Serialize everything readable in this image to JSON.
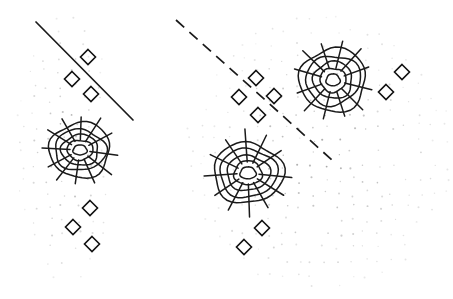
{
  "figure": {
    "title": "",
    "background_color": "#ffffff",
    "width": 453,
    "height": 299,
    "panel_count": 2
  },
  "style": {
    "dot_color": "#8a8a8a",
    "marker_color": "#111111",
    "contour_color": "#1a1a1a",
    "boundary_color": "#1a1a1a"
  },
  "chart_data": {
    "type": "scatter",
    "title": "",
    "subtitle": "",
    "xlabel": "",
    "ylabel": "",
    "grid": false,
    "legend": null,
    "axis_visible": false,
    "tick_labels": [],
    "annotations": [],
    "panels": [
      {
        "name": "left-panel",
        "label": "",
        "boundary": {
          "style": "solid",
          "x1": 36,
          "y1": 22,
          "x2": 133,
          "y2": 120
        },
        "clusters": [
          {
            "name": "left-cluster",
            "cx": 80,
            "cy": 150,
            "rings": [
              {
                "rx": 7,
                "ry": 5
              },
              {
                "rx": 13,
                "ry": 10
              },
              {
                "rx": 19,
                "ry": 15
              },
              {
                "rx": 25,
                "ry": 21
              },
              {
                "rx": 31,
                "ry": 27
              }
            ],
            "spokes": [
              {
                "angle": 8,
                "inner": 10,
                "outer": 38
              },
              {
                "angle": 38,
                "inner": 10,
                "outer": 40
              },
              {
                "angle": 66,
                "inner": 10,
                "outer": 36
              },
              {
                "angle": 98,
                "inner": 10,
                "outer": 34
              },
              {
                "angle": 128,
                "inner": 10,
                "outer": 38
              },
              {
                "angle": 152,
                "inner": 10,
                "outer": 36
              },
              {
                "angle": 183,
                "inner": 10,
                "outer": 38
              },
              {
                "angle": 212,
                "inner": 10,
                "outer": 38
              },
              {
                "angle": 240,
                "inner": 10,
                "outer": 36
              },
              {
                "angle": 272,
                "inner": 10,
                "outer": 33
              },
              {
                "angle": 303,
                "inner": 10,
                "outer": 38
              },
              {
                "angle": 332,
                "inner": 10,
                "outer": 36
              }
            ]
          }
        ],
        "markers": [
          {
            "x": 88,
            "y": 57,
            "size": 7.5
          },
          {
            "x": 72,
            "y": 79,
            "size": 7.5
          },
          {
            "x": 91,
            "y": 94,
            "size": 7.5
          },
          {
            "x": 90,
            "y": 208,
            "size": 7.5
          },
          {
            "x": 73,
            "y": 227,
            "size": 7.5
          },
          {
            "x": 92,
            "y": 244,
            "size": 7.5
          }
        ],
        "points_seed": 11,
        "points_region": {
          "x0": 18,
          "y0": 18,
          "x1": 115,
          "y1": 278,
          "skew": 0.22,
          "count": 210
        }
      },
      {
        "name": "right-panel",
        "label": "",
        "boundary": {
          "style": "dashed",
          "x1": 176,
          "y1": 20,
          "x2": 332,
          "y2": 160
        },
        "clusters": [
          {
            "name": "right-upper-cluster",
            "cx": 333,
            "cy": 80,
            "rings": [
              {
                "rx": 7,
                "ry": 6
              },
              {
                "rx": 13,
                "ry": 12
              },
              {
                "rx": 20,
                "ry": 18
              },
              {
                "rx": 27,
                "ry": 25
              },
              {
                "rx": 34,
                "ry": 31
              }
            ],
            "spokes": [
              {
                "angle": 14,
                "inner": 12,
                "outer": 40
              },
              {
                "angle": 45,
                "inner": 12,
                "outer": 42
              },
              {
                "angle": 72,
                "inner": 12,
                "outer": 38
              },
              {
                "angle": 104,
                "inner": 12,
                "outer": 40
              },
              {
                "angle": 133,
                "inner": 12,
                "outer": 42
              },
              {
                "angle": 160,
                "inner": 12,
                "outer": 38
              },
              {
                "angle": 196,
                "inner": 12,
                "outer": 40
              },
              {
                "angle": 224,
                "inner": 12,
                "outer": 42
              },
              {
                "angle": 252,
                "inner": 12,
                "outer": 38
              },
              {
                "angle": 284,
                "inner": 12,
                "outer": 40
              },
              {
                "angle": 312,
                "inner": 12,
                "outer": 42
              },
              {
                "angle": 340,
                "inner": 12,
                "outer": 38
              }
            ]
          },
          {
            "name": "right-lower-cluster",
            "cx": 248,
            "cy": 173,
            "rings": [
              {
                "rx": 8,
                "ry": 6
              },
              {
                "rx": 14,
                "ry": 12
              },
              {
                "rx": 21,
                "ry": 18
              },
              {
                "rx": 28,
                "ry": 25
              },
              {
                "rx": 34,
                "ry": 31
              }
            ],
            "spokes": [
              {
                "angle": 6,
                "inner": 11,
                "outer": 44
              },
              {
                "angle": 32,
                "inner": 11,
                "outer": 42
              },
              {
                "angle": 60,
                "inner": 11,
                "outer": 40
              },
              {
                "angle": 88,
                "inner": 11,
                "outer": 44
              },
              {
                "angle": 118,
                "inner": 11,
                "outer": 42
              },
              {
                "angle": 146,
                "inner": 11,
                "outer": 40
              },
              {
                "angle": 176,
                "inner": 11,
                "outer": 44
              },
              {
                "angle": 206,
                "inner": 11,
                "outer": 42
              },
              {
                "angle": 236,
                "inner": 11,
                "outer": 40
              },
              {
                "angle": 266,
                "inner": 11,
                "outer": 44
              },
              {
                "angle": 296,
                "inner": 11,
                "outer": 42
              },
              {
                "angle": 326,
                "inner": 11,
                "outer": 40
              }
            ]
          }
        ],
        "markers": [
          {
            "x": 256,
            "y": 78,
            "size": 7.5
          },
          {
            "x": 239,
            "y": 97,
            "size": 7.5
          },
          {
            "x": 274,
            "y": 96,
            "size": 7.5
          },
          {
            "x": 258,
            "y": 115,
            "size": 7.5
          },
          {
            "x": 402,
            "y": 72,
            "size": 7.5
          },
          {
            "x": 386,
            "y": 92,
            "size": 7.5
          },
          {
            "x": 262,
            "y": 228,
            "size": 7.5
          },
          {
            "x": 244,
            "y": 247,
            "size": 7.5
          }
        ],
        "points_seed": 29,
        "points_region": {
          "x0": 190,
          "y0": 18,
          "x1": 448,
          "y1": 288,
          "skew": 0.0,
          "count": 300
        }
      }
    ]
  }
}
